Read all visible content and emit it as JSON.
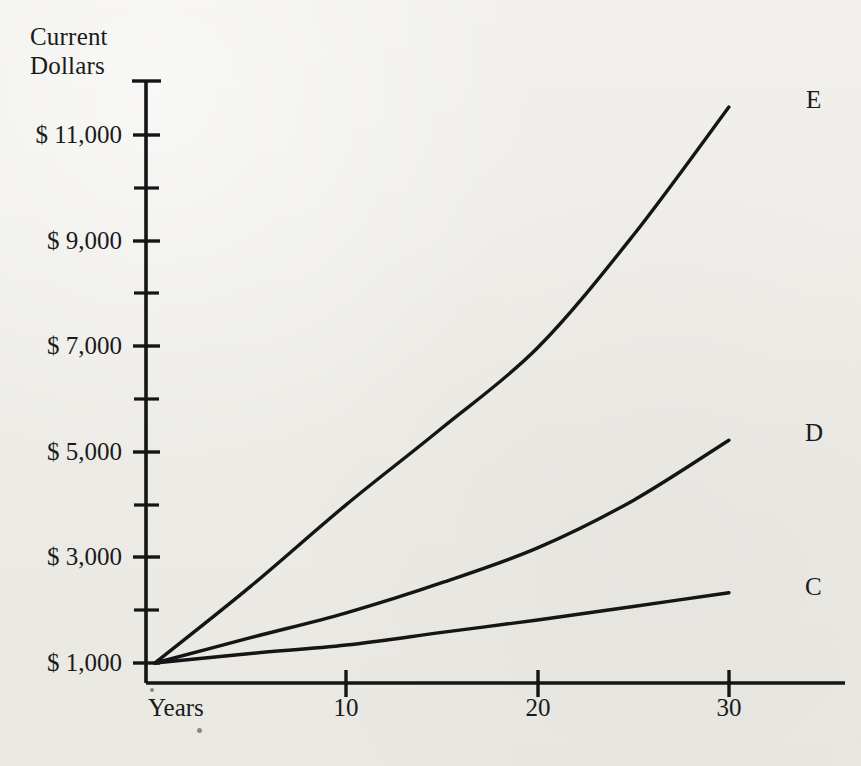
{
  "figure": {
    "background_color": "#ecebe6",
    "ink_color": "#151515"
  },
  "axes": {
    "y_axis_title": "Current\nDollars",
    "x_axis_name": "Years",
    "y_tick_labels": [
      "$ 11,000",
      "$ 9,000",
      "$ 7,000",
      "$ 5,000",
      "$ 3,000",
      "$ 1,000"
    ],
    "x_tick_labels": [
      "10",
      "20",
      "30"
    ]
  },
  "series_labels": {
    "e": "E",
    "d": "D",
    "c": "C"
  },
  "chart_data": {
    "type": "line",
    "title": "",
    "subtitle": "",
    "xlabel": "Years",
    "ylabel": "Current Dollars",
    "xlim": [
      0,
      31
    ],
    "ylim": [
      1000,
      12000
    ],
    "x_ticks": [
      10,
      20,
      30
    ],
    "y_ticks": [
      1000,
      3000,
      5000,
      7000,
      9000,
      11000
    ],
    "y_minor_ticks": [
      2000,
      4000,
      6000,
      8000,
      10000,
      12000
    ],
    "grid": false,
    "legend_position": "end-of-line",
    "x": [
      0,
      5,
      10,
      15,
      20,
      25,
      30
    ],
    "series": [
      {
        "name": "E",
        "label": "E",
        "values": [
          1000,
          2450,
          4000,
          5450,
          6970,
          9100,
          11530
        ]
      },
      {
        "name": "D",
        "label": "D",
        "values": [
          1000,
          1480,
          1950,
          2520,
          3180,
          4080,
          5220
        ]
      },
      {
        "name": "C",
        "label": "C",
        "values": [
          1000,
          1180,
          1340,
          1580,
          1815,
          2070,
          2330
        ]
      }
    ],
    "annotations": [
      {
        "text": "E",
        "x": 30,
        "y": 11530
      },
      {
        "text": "D",
        "x": 30,
        "y": 5220
      },
      {
        "text": "C",
        "x": 30,
        "y": 2330
      }
    ]
  }
}
